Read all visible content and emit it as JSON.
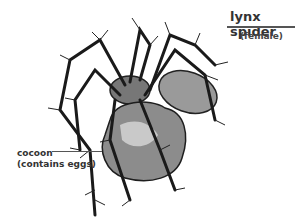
{
  "figure": {
    "title": "lynx spider",
    "subtitle": "(female)",
    "labels": [
      {
        "id": "cocoon",
        "line1": "cocoon",
        "line2": "(contains eggs)"
      }
    ],
    "colors": {
      "text": "#333333",
      "spider_dark": "#1a1a1a",
      "spider_mid": "#7a7a7a",
      "spider_light": "#c8c8c8"
    }
  }
}
